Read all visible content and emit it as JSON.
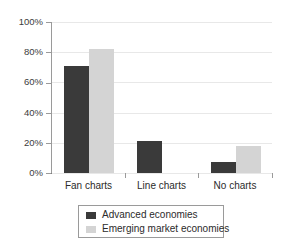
{
  "chart_data": {
    "type": "bar",
    "title": "",
    "subtitle": "",
    "xlabel": "",
    "ylabel": "",
    "categories": [
      "Fan charts",
      "Line charts",
      "No charts"
    ],
    "series": [
      {
        "name": "Advanced economies",
        "color": "#3a3a3a",
        "values": [
          71,
          21,
          7
        ]
      },
      {
        "name": "Emerging market economies",
        "color": "#d4d4d4",
        "values": [
          82,
          0,
          18
        ]
      }
    ],
    "ylim": [
      0,
      100
    ],
    "ytick_values": [
      0,
      20,
      40,
      60,
      80,
      100
    ],
    "ytick_labels": [
      "0%",
      "20%",
      "40%",
      "60%",
      "80%",
      "100%"
    ],
    "grid": true,
    "grid_axis": "y",
    "legend_position": "bottom",
    "value_suffix": "%"
  },
  "axes": {
    "y_tick_labels": [
      "100%",
      "80%",
      "60%",
      "40%",
      "20%",
      "0%"
    ]
  },
  "legend": {
    "entries": [
      {
        "label": "Advanced economies"
      },
      {
        "label": "Emerging market economies"
      }
    ]
  }
}
